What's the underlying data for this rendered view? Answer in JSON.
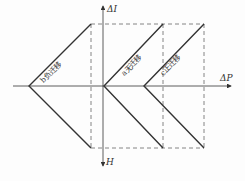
{
  "diagram": {
    "axes": {
      "horizontal_label": "ΔP",
      "vertical_up_label": "ΔI",
      "vertical_down_label": "H"
    },
    "curves": [
      {
        "id": "b",
        "label": "b负迁移",
        "vertex_x": 29,
        "top_x": 91,
        "bottom_x": 91
      },
      {
        "id": "a",
        "label": "a无迁移",
        "vertex_x": 104,
        "top_x": 163,
        "bottom_x": 163
      },
      {
        "id": "c",
        "label": "c正迁移",
        "vertex_x": 144,
        "top_x": 204,
        "bottom_x": 204
      }
    ],
    "colors": {
      "line": "#333333",
      "dashed": "#666666"
    }
  }
}
